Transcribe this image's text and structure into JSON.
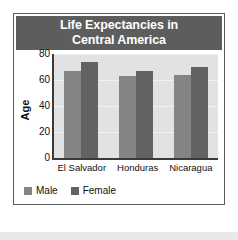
{
  "chart_data": {
    "type": "bar",
    "title": "Life Expectancies in Central America",
    "title_lines": [
      "Life Expectancies in",
      "Central America"
    ],
    "categories": [
      "El Salvador",
      "Honduras",
      "Nicaragua"
    ],
    "series": [
      {
        "name": "Male",
        "color": "#848484",
        "values": [
          67,
          63,
          64
        ]
      },
      {
        "name": "Female",
        "color": "#626262",
        "values": [
          74,
          67,
          70
        ]
      }
    ],
    "xlabel": "",
    "ylabel": "Age",
    "ylim": [
      0,
      80
    ],
    "yticks": [
      0,
      20,
      40,
      60,
      80
    ],
    "ytick_labels": [
      "0",
      "20",
      "40",
      "60",
      "80"
    ],
    "grid": true,
    "legend_position": "bottom-left",
    "plot_background": "#e2e2e2",
    "header_background": "#5d5d5d",
    "title_color": "#ffffff",
    "axis_color": "#3a3a3a"
  }
}
